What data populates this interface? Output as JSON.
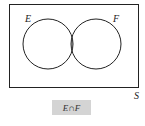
{
  "diagram": {
    "type": "venn",
    "sets": [
      {
        "label": "E"
      },
      {
        "label": "F"
      }
    ],
    "universe_label": "S",
    "highlighted_region": "intersection",
    "caption": "E∩F",
    "colors": {
      "shade": "#c0c0c0",
      "stroke": "#222222",
      "caption_bg": "#d4d4d4"
    }
  }
}
